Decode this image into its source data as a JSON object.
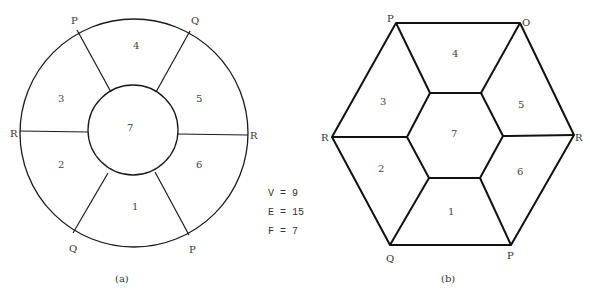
{
  "diagram_a": {
    "caption": "(a)",
    "vertex_labels": {
      "P_top": "P",
      "Q_top": "Q",
      "R_left": "R",
      "R_right": "R",
      "Q_bottom": "Q",
      "P_bottom": "P"
    },
    "faces": [
      "1",
      "2",
      "3",
      "4",
      "5",
      "6",
      "7"
    ]
  },
  "diagram_b": {
    "caption": "(b)",
    "vertex_labels": {
      "P_top": "P",
      "Q_top": "O",
      "R_left": "R",
      "R_right": "R",
      "Q_bottom": "Q",
      "P_bottom": "P"
    },
    "faces": [
      "1",
      "2",
      "3",
      "4",
      "5",
      "6",
      "7"
    ]
  },
  "stats": {
    "V": "V = 9",
    "E": "E = 15",
    "F": "F = 7"
  },
  "colors": {
    "stroke": "#1a1a1a",
    "background": "#ffffff"
  }
}
